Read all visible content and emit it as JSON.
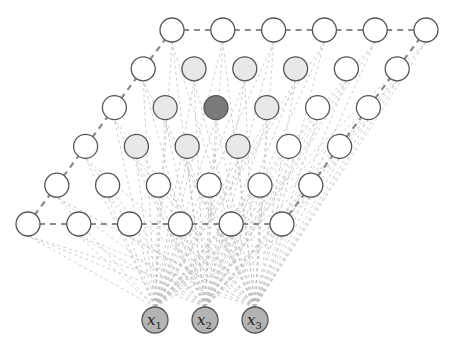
{
  "diagram": {
    "grid": {
      "rows": 6,
      "cols": 6,
      "origin": [
        28,
        224
      ],
      "col_step": [
        50.8,
        0
      ],
      "row_step": [
        28.8,
        -38.8
      ],
      "node_radius": 12
    },
    "colors": {
      "node_default": "#ffffff",
      "node_neighbor": "#e8e8e8",
      "node_winner": "#7a7a7a",
      "input_node": "#b4b4b4",
      "stroke": "#555555",
      "border_edge": "#8a8a8a",
      "input_edge": "#b8b8b8"
    },
    "winner": {
      "row": 3,
      "col": 2
    },
    "neighbors": [
      {
        "row": 4,
        "col": 1
      },
      {
        "row": 4,
        "col": 2
      },
      {
        "row": 4,
        "col": 3
      },
      {
        "row": 3,
        "col": 1
      },
      {
        "row": 3,
        "col": 3
      },
      {
        "row": 2,
        "col": 1
      },
      {
        "row": 2,
        "col": 2
      },
      {
        "row": 2,
        "col": 3
      }
    ],
    "inputs": [
      {
        "label": "x",
        "sub": "1",
        "cx": 155,
        "cy": 320
      },
      {
        "label": "x",
        "sub": "2",
        "cx": 205,
        "cy": 320
      },
      {
        "label": "x",
        "sub": "3",
        "cx": 255,
        "cy": 320
      }
    ],
    "input_radius": 13
  }
}
